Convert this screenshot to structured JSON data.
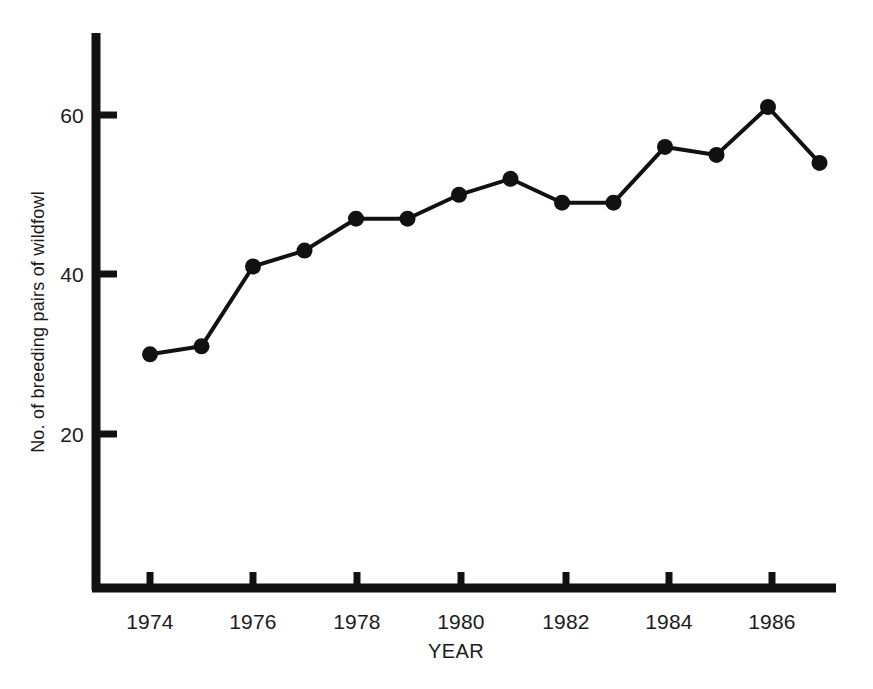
{
  "chart_data": {
    "type": "line",
    "title": "",
    "xlabel": "YEAR",
    "ylabel": "No. of breeding pairs of wildfowl",
    "x": [
      1974,
      1975,
      1976,
      1977,
      1978,
      1979,
      1980,
      1981,
      1982,
      1983,
      1984,
      1985,
      1986,
      1987
    ],
    "values": [
      30,
      31,
      41,
      43,
      47,
      47,
      50,
      52,
      49,
      49,
      56,
      55,
      61,
      54
    ],
    "series": [
      {
        "name": "No. of breeding pairs of wildfowl",
        "values": [
          30,
          31,
          41,
          43,
          47,
          47,
          50,
          52,
          49,
          49,
          56,
          55,
          61,
          54
        ]
      }
    ],
    "xlim": [
      1973,
      1987.6
    ],
    "ylim": [
      0,
      66
    ],
    "xticks": [
      1974,
      1976,
      1978,
      1980,
      1982,
      1984,
      1986
    ],
    "xtick_labels": [
      "1974",
      "1976",
      "1978",
      "1980",
      "1982",
      "1984",
      "1986"
    ],
    "yticks": [
      20,
      40,
      60
    ],
    "ytick_labels": [
      "20",
      "40",
      "60"
    ],
    "grid": false,
    "legend": "none",
    "marker": "filled-circle",
    "line_color": "#111111",
    "marker_color": "#111111",
    "background_color": "#ffffff"
  },
  "caption": {
    "partial_line": ""
  }
}
